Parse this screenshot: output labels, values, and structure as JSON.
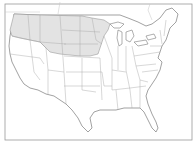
{
  "map": {
    "type": "outline-map",
    "region": "Contiguous United States",
    "highlighted_region": "Northern tier states (shaded)",
    "highlighted_states": [
      "Washington",
      "Oregon",
      "Idaho",
      "Montana",
      "Wyoming",
      "North Dakota",
      "South Dakota",
      "Nebraska",
      "Minnesota",
      "Iowa",
      "Wisconsin"
    ],
    "colors": {
      "highlight_fill": "#e3e3e3",
      "background": "#ffffff",
      "outline": "#7a7a7a",
      "state_lines": "#a8a8a8",
      "frame": "#9a9a9a"
    }
  }
}
